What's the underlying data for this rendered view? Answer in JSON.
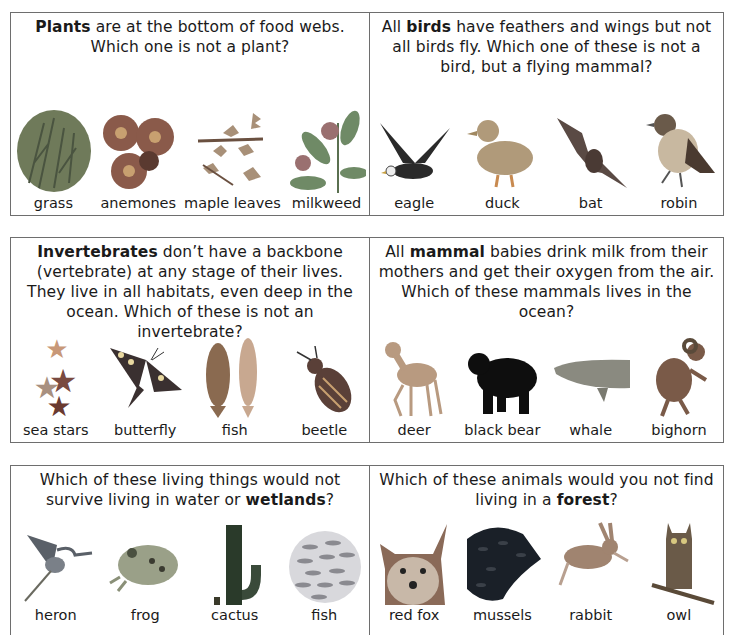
{
  "panels": [
    {
      "id": "plants",
      "question_pre": "",
      "question_bold": "Plants",
      "question_post": " are at the bottom of food webs. Which one is not a plant?",
      "items": [
        {
          "label": "grass",
          "icon": "grass-icon",
          "color": "#6f7a5a"
        },
        {
          "label": "anemones",
          "icon": "anemone-icon",
          "color": "#8a5a4a"
        },
        {
          "label": "maple leaves",
          "icon": "maple-leaf-icon",
          "color": "#a89078"
        },
        {
          "label": "milkweed",
          "icon": "milkweed-icon",
          "color": "#6f8a66"
        }
      ]
    },
    {
      "id": "birds",
      "question_pre": "All ",
      "question_bold": "birds",
      "question_post": " have feathers and wings but not all birds fly. Which one of these is not a bird, but a flying mammal?",
      "items": [
        {
          "label": "eagle",
          "icon": "eagle-icon",
          "color": "#2a2a2a"
        },
        {
          "label": "duck",
          "icon": "duck-icon",
          "color": "#b09a7a"
        },
        {
          "label": "bat",
          "icon": "bat-icon",
          "color": "#5a4a44"
        },
        {
          "label": "robin",
          "icon": "robin-icon",
          "color": "#6a5a4a"
        }
      ]
    },
    {
      "id": "invertebrates",
      "question_pre": "",
      "question_bold": "Invertebrates",
      "question_post": " don’t have a backbone (vertebrate) at any stage of their lives. They live in all habitats, even deep in the ocean. Which of these is not an invertebrate?",
      "items": [
        {
          "label": "sea stars",
          "icon": "sea-star-icon",
          "color": "#8a5a50"
        },
        {
          "label": "butterfly",
          "icon": "butterfly-icon",
          "color": "#3a3030"
        },
        {
          "label": "fish",
          "icon": "fish-icon",
          "color": "#9a7a60"
        },
        {
          "label": "beetle",
          "icon": "beetle-icon",
          "color": "#5a4038"
        }
      ]
    },
    {
      "id": "mammals",
      "question_pre": "All ",
      "question_bold": "mammal",
      "question_post": " babies drink milk from their mothers and get their oxygen from the air. Which of these mammals lives in the ocean?",
      "items": [
        {
          "label": "deer",
          "icon": "deer-icon",
          "color": "#b89a80"
        },
        {
          "label": "black bear",
          "icon": "bear-icon",
          "color": "#0e0e0e"
        },
        {
          "label": "whale",
          "icon": "whale-icon",
          "color": "#8a8a80"
        },
        {
          "label": "bighorn",
          "icon": "bighorn-icon",
          "color": "#7a5a48"
        }
      ]
    },
    {
      "id": "wetlands",
      "question_pre": "Which of these living things would not survive living in water or ",
      "question_bold": "wetlands",
      "question_post": "?",
      "items": [
        {
          "label": "heron",
          "icon": "heron-icon",
          "color": "#5a6068"
        },
        {
          "label": "frog",
          "icon": "frog-icon",
          "color": "#7a8a6a"
        },
        {
          "label": "cactus",
          "icon": "cactus-icon",
          "color": "#2a3a2a"
        },
        {
          "label": "fish",
          "icon": "fish-school-icon",
          "color": "#8a8a90"
        }
      ]
    },
    {
      "id": "forest",
      "question_pre": "Which of these animals would you not find living in a ",
      "question_bold": "forest",
      "question_post": "?",
      "items": [
        {
          "label": "red fox",
          "icon": "fox-icon",
          "color": "#8a5a40"
        },
        {
          "label": "mussels",
          "icon": "mussels-icon",
          "color": "#1a2028"
        },
        {
          "label": "rabbit",
          "icon": "rabbit-icon",
          "color": "#a08470"
        },
        {
          "label": "owl",
          "icon": "owl-icon",
          "color": "#6a5a48"
        }
      ]
    }
  ]
}
